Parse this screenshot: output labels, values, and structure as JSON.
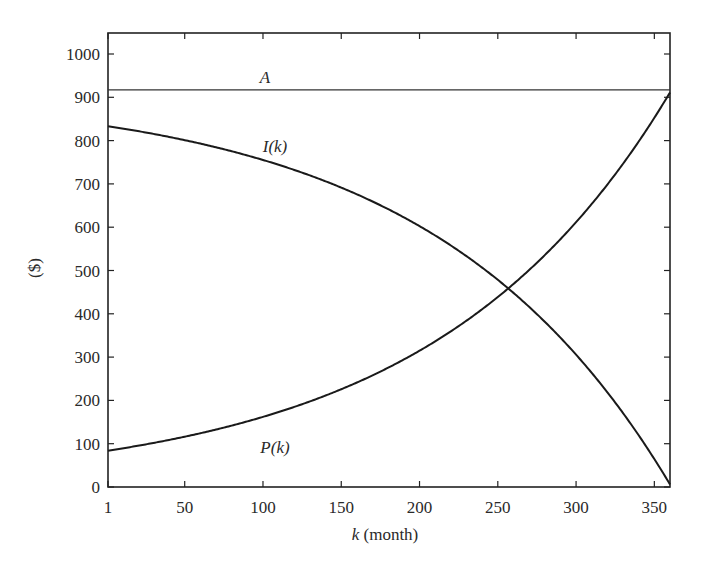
{
  "chart_data": {
    "type": "line",
    "title": "",
    "xlabel_var": "k",
    "xlabel_unit": " (month)",
    "xlabel": "k (month)",
    "ylabel": "($)",
    "xlim": [
      1,
      360
    ],
    "ylim": [
      0,
      1050
    ],
    "grid": false,
    "legend": "none (inline curve labels)",
    "xticks": [
      1,
      50,
      100,
      150,
      200,
      250,
      300,
      350
    ],
    "yticks": [
      0,
      100,
      200,
      300,
      400,
      500,
      600,
      700,
      800,
      900,
      1000
    ],
    "x": [
      1,
      50,
      100,
      150,
      200,
      250,
      300,
      350,
      360
    ],
    "series": [
      {
        "name": "A",
        "label": "A",
        "values": [
          917.2,
          917.2,
          917.2,
          917.2,
          917.2,
          917.2,
          917.2,
          917.2,
          917.2
        ]
      },
      {
        "name": "I(k)",
        "label": "I(k)",
        "values": [
          833.3,
          801.0,
          755.3,
          691.5,
          602.5,
          478.5,
          305.6,
          64.6,
          6.0
        ]
      },
      {
        "name": "P(k)",
        "label": "P(k)",
        "values": [
          83.9,
          116.2,
          161.9,
          225.7,
          314.7,
          438.7,
          611.6,
          852.6,
          911.2
        ]
      }
    ],
    "annotations": [
      {
        "text": "A",
        "x": 100,
        "y": 940
      },
      {
        "text": "I(k)",
        "x": 100,
        "y": 775
      },
      {
        "text": "P(k)",
        "x": 100,
        "y": 90
      }
    ],
    "model": {
      "payment_A": 917.21,
      "monthly_rate": 0.0066667,
      "P1": 83.88
    }
  }
}
